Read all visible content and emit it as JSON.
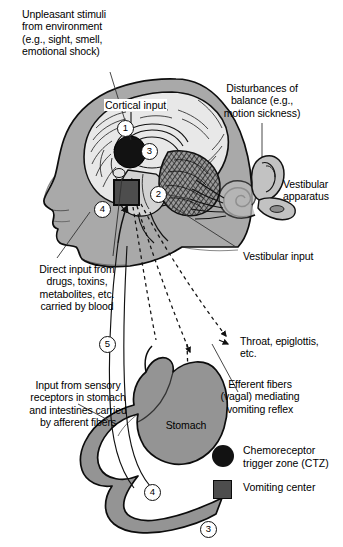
{
  "figure": {
    "domain": "physiology-diagram"
  },
  "annotations": {
    "unpleasant_stimuli": "Unpleasant stimuli\nfrom environment\n(e.g., sight, smell,\nemotional shock)",
    "cortical_input": "Cortical input",
    "disturbances_balance": "Disturbances of\nbalance (e.g.,\nmotion sickness)",
    "vestibular_apparatus": "Vestibular\napparatus",
    "vestibular_input": "Vestibular input",
    "direct_input": "Direct input from\ndrugs, toxins,\nmetabolites, etc.\ncarried by blood",
    "sensory_input": "Input from sensory\nreceptors in stomach\nand intestines carried\nby afferent fibers",
    "throat_epiglottis": "Throat, epiglottis,\netc.",
    "efferent_fibers": "Efferent fibers\n(vagal) mediating\nvomiting reflex",
    "stomach": "Stomach"
  },
  "legend": {
    "items": [
      {
        "symbol": "circle",
        "color": "#121212",
        "label": "Chemoreceptor\ntrigger zone (CTZ)"
      },
      {
        "symbol": "square",
        "color": "#4d4d4d",
        "label": "Vomiting center"
      }
    ]
  },
  "markers": [
    {
      "id": "marker-1",
      "label": "1",
      "x": 117,
      "y": 120
    },
    {
      "id": "marker-2",
      "label": "2",
      "x": 150,
      "y": 186
    },
    {
      "id": "marker-3",
      "label": "3",
      "x": 141,
      "y": 143
    },
    {
      "id": "marker-4",
      "label": "4",
      "x": 94,
      "y": 201
    },
    {
      "id": "marker-5",
      "label": "5",
      "x": 99,
      "y": 336
    },
    {
      "id": "marker-4b",
      "label": "4",
      "x": 144,
      "y": 484
    },
    {
      "id": "marker-3b",
      "label": "3",
      "x": 200,
      "y": 521
    }
  ],
  "colors": {
    "background": "#ffffff",
    "head_fill": "#a9a9a9",
    "brain_fill": "#e8e8e8",
    "brain_line": "#1a1a1a",
    "cerebellum_fill": "#8f8f8f",
    "stomach_fill": "#949494",
    "ctz_black": "#121212",
    "vomiting_center": "#4d4d4d",
    "ear_fill": "#b4b4b4",
    "outline": "#000000"
  }
}
